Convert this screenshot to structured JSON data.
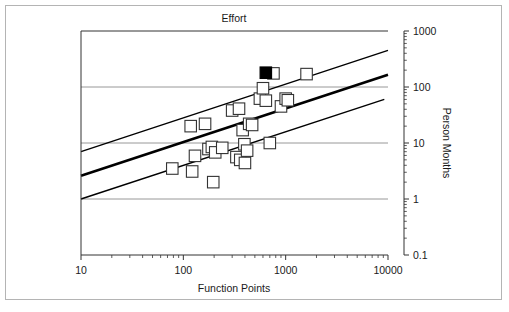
{
  "figure": {
    "background": "#ffffff",
    "frame_color": "#b4b4b4"
  },
  "chart_data": {
    "type": "scatter",
    "title": "Effort",
    "xlabel": "Function Points",
    "ylabel": "Person Months",
    "xscale": "log",
    "yscale": "log",
    "xlim": [
      10,
      10000
    ],
    "ylim": [
      0.1,
      1000
    ],
    "xticks": [
      10,
      100,
      1000,
      10000
    ],
    "xticklabels": [
      "10",
      "100",
      "1000",
      "10000"
    ],
    "yticks": [
      0.1,
      1,
      10,
      100,
      1000
    ],
    "yticklabels": [
      "0.1",
      "1",
      "10",
      "100",
      "1000"
    ],
    "grid": "horizontal-major",
    "gridlines_y": [
      1,
      10,
      100
    ],
    "legend": null,
    "marker": "open-square",
    "marker_color": "#ffffff",
    "marker_edge_color": "#333333",
    "highlight_marker": "filled-square",
    "highlight_marker_color": "#000000",
    "series": [
      {
        "name": "Projects",
        "marker": "open-square",
        "points": [
          {
            "x": 78,
            "y": 3.5
          },
          {
            "x": 118,
            "y": 20
          },
          {
            "x": 122,
            "y": 3.1
          },
          {
            "x": 130,
            "y": 5.9
          },
          {
            "x": 163,
            "y": 22
          },
          {
            "x": 176,
            "y": 7.8
          },
          {
            "x": 190,
            "y": 8.5
          },
          {
            "x": 196,
            "y": 2.0
          },
          {
            "x": 205,
            "y": 6.8
          },
          {
            "x": 240,
            "y": 8.2
          },
          {
            "x": 300,
            "y": 38
          },
          {
            "x": 330,
            "y": 5.6
          },
          {
            "x": 350,
            "y": 41
          },
          {
            "x": 360,
            "y": 5.0
          },
          {
            "x": 380,
            "y": 17
          },
          {
            "x": 395,
            "y": 9.5
          },
          {
            "x": 400,
            "y": 4.4
          },
          {
            "x": 420,
            "y": 7.3
          },
          {
            "x": 440,
            "y": 22
          },
          {
            "x": 470,
            "y": 21
          },
          {
            "x": 560,
            "y": 62
          },
          {
            "x": 600,
            "y": 95
          },
          {
            "x": 640,
            "y": 57
          },
          {
            "x": 700,
            "y": 10
          },
          {
            "x": 760,
            "y": 175
          },
          {
            "x": 900,
            "y": 45
          },
          {
            "x": 1000,
            "y": 62
          },
          {
            "x": 1050,
            "y": 58
          },
          {
            "x": 1600,
            "y": 170
          }
        ]
      },
      {
        "name": "Highlighted project",
        "marker": "filled-square",
        "points": [
          {
            "x": 640,
            "y": 180
          }
        ]
      }
    ],
    "trend_lines": [
      {
        "name": "upper-bound-line",
        "style": "thin",
        "width": 1.4,
        "color": "#000000",
        "x1": 10,
        "y1": 7.0,
        "x2": 10000,
        "y2": 450
      },
      {
        "name": "fit-line",
        "style": "thick",
        "width": 2.6,
        "color": "#000000",
        "x1": 10,
        "y1": 2.6,
        "x2": 10000,
        "y2": 165
      },
      {
        "name": "lower-bound-line",
        "style": "thin",
        "width": 1.4,
        "color": "#000000",
        "x1": 10,
        "y1": 1.0,
        "x2": 9200,
        "y2": 60
      }
    ]
  }
}
